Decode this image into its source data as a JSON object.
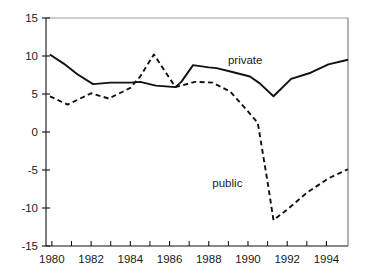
{
  "chart_data": {
    "type": "line",
    "title": "",
    "subtitle": "",
    "xlabel": "",
    "ylabel": "",
    "xlim": [
      1979.7,
      1995.1
    ],
    "ylim": [
      -15,
      15
    ],
    "grid": false,
    "legend_position": "inline-annotations",
    "x_ticks_major": [
      1980,
      1982,
      1984,
      1986,
      1988,
      1990,
      1992,
      1994
    ],
    "x_ticks_minor": [
      1981,
      1983,
      1985,
      1987,
      1989,
      1991,
      1993
    ],
    "x_tick_labels": [
      "1980",
      "1982",
      "1984",
      "1986",
      "1988",
      "1990",
      "1992",
      "1994"
    ],
    "y_ticks": [
      15,
      10,
      5,
      0,
      -5,
      -10,
      -15
    ],
    "y_tick_labels": [
      "15",
      "10",
      "5",
      "0",
      "-5",
      "-10",
      "-15"
    ],
    "series": [
      {
        "name": "private",
        "style": "solid",
        "color": "#111111",
        "label": "private",
        "label_x": 1990.1,
        "label_y": 9.3,
        "x": [
          1979.9,
          1980.6,
          1981.3,
          1982.1,
          1983.0,
          1984.0,
          1984.5,
          1985.3,
          1986.3,
          1986.6,
          1987.2,
          1988.0,
          1988.4,
          1989.2,
          1990.1,
          1990.6,
          1991.3,
          1992.2,
          1993.2,
          1994.1,
          1995.1
        ],
        "y": [
          10.2,
          9.0,
          7.6,
          6.3,
          6.5,
          6.5,
          6.6,
          6.1,
          5.9,
          6.6,
          8.8,
          8.5,
          8.4,
          7.9,
          7.3,
          6.4,
          4.7,
          7.0,
          7.8,
          8.9,
          9.5
        ]
      },
      {
        "name": "public",
        "style": "dashed",
        "color": "#111111",
        "label": "public",
        "label_x": 1989.1,
        "label_y": -6.8,
        "x": [
          1979.9,
          1980.8,
          1982.0,
          1982.9,
          1984.0,
          1984.5,
          1985.2,
          1986.3,
          1987.3,
          1988.2,
          1989.1,
          1990.0,
          1990.5,
          1991.0,
          1991.3,
          1992.0,
          1993.0,
          1994.1,
          1995.1
        ],
        "y": [
          4.7,
          3.6,
          5.1,
          4.4,
          5.8,
          7.3,
          10.2,
          5.9,
          6.6,
          6.5,
          5.3,
          2.7,
          1.2,
          -6.6,
          -11.6,
          -10.2,
          -8.0,
          -6.1,
          -4.9
        ]
      }
    ]
  },
  "axes_geometry": {
    "left_px": 46,
    "right_px": 348,
    "top_px": 18,
    "bottom_px": 246
  }
}
